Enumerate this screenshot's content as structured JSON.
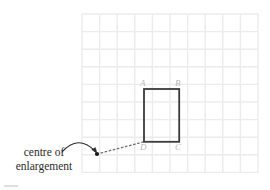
{
  "figure": {
    "width": 270,
    "height": 190,
    "background_color": "#ffffff"
  },
  "colors": {
    "grid_line": "#ececed",
    "shape_stroke": "#3a3a3c",
    "vertex_label": "#b9b9bb",
    "caption_text": "#2b2b2b",
    "ray_line": "#6f6f74",
    "arrow": "#2b2b2b",
    "centre_point": "#17171a",
    "footer_rule": "#d8d8da"
  },
  "grid": {
    "origin_x": 82,
    "origin_y": 14,
    "cell_size": 17.6,
    "columns": 10,
    "rows": 9,
    "visible": true
  },
  "shape": {
    "name": "rectangle-ABCD",
    "stroke_width": 1.8,
    "fill": "none",
    "x": 144,
    "y": 89,
    "width": 35.2,
    "height": 52.8,
    "vertices": [
      {
        "id": "A",
        "label": "A",
        "corner": "top-left",
        "x": 144,
        "y": 89,
        "label_x": 140,
        "label_y": 79
      },
      {
        "id": "B",
        "label": "B",
        "corner": "top-right",
        "x": 179.2,
        "y": 89,
        "label_x": 175,
        "label_y": 79
      },
      {
        "id": "C",
        "label": "C",
        "corner": "bottom-right",
        "x": 179.2,
        "y": 141.8,
        "label_x": 175,
        "label_y": 143
      },
      {
        "id": "D",
        "label": "D",
        "corner": "bottom-left",
        "x": 144,
        "y": 141.8,
        "label_x": 140,
        "label_y": 143
      }
    ]
  },
  "centre_of_enlargement": {
    "point_x": 97,
    "point_y": 154,
    "dot_radius": 2.1,
    "caption_line_1": "centre of",
    "caption_line_2": "enlargement",
    "ray": {
      "from_x": 97,
      "from_y": 154,
      "to_x": 144,
      "to_y": 141.8,
      "style": "dotted"
    },
    "pointer_arrow": {
      "start_x": 62,
      "start_y": 152,
      "control_x": 78,
      "control_y": 134,
      "end_x": 95,
      "end_y": 151
    }
  },
  "footer": {
    "rule_visible": true,
    "rule_x": 4,
    "rule_y": 186,
    "rule_width": 14
  }
}
